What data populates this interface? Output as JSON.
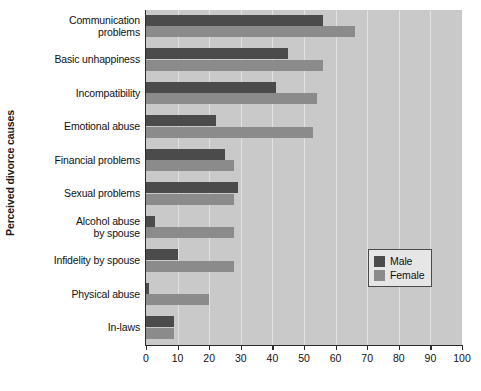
{
  "chart_data": {
    "type": "bar",
    "orientation": "horizontal",
    "title": "",
    "xlabel": "",
    "ylabel": "Perceived divorce causes",
    "xlim": [
      0,
      100
    ],
    "xticks": [
      0,
      10,
      20,
      30,
      40,
      50,
      60,
      70,
      80,
      90,
      100
    ],
    "grid": true,
    "legend_position": "center-right",
    "categories": [
      "Communication problems",
      "Basic unhappiness",
      "Incompatibility",
      "Emotional abuse",
      "Financial problems",
      "Sexual problems",
      "Alcohol abuse by spouse",
      "Infidelity by spouse",
      "Physical abuse",
      "In-laws"
    ],
    "series": [
      {
        "name": "Male",
        "color": "#4b4b4b",
        "values": [
          56,
          45,
          41,
          22,
          25,
          29,
          3,
          10,
          1,
          9
        ]
      },
      {
        "name": "Female",
        "color": "#8b8b8b",
        "values": [
          66,
          56,
          54,
          53,
          28,
          28,
          28,
          28,
          20,
          9
        ]
      }
    ]
  },
  "axis": {
    "y_title": "Perceived divorce causes",
    "x_tick_labels": [
      "0",
      "10",
      "20",
      "30",
      "40",
      "50",
      "60",
      "70",
      "80",
      "90",
      "100"
    ]
  },
  "category_labels": [
    {
      "line1": "Communication",
      "line2": "problems"
    },
    {
      "line1": "Basic unhappiness",
      "line2": ""
    },
    {
      "line1": "Incompatibility",
      "line2": ""
    },
    {
      "line1": "Emotional abuse",
      "line2": ""
    },
    {
      "line1": "Financial problems",
      "line2": ""
    },
    {
      "line1": "Sexual problems",
      "line2": ""
    },
    {
      "line1": "Alcohol abuse",
      "line2": "by spouse"
    },
    {
      "line1": "Infidelity by spouse",
      "line2": ""
    },
    {
      "line1": "Physical abuse",
      "line2": ""
    },
    {
      "line1": "In-laws",
      "line2": ""
    }
  ],
  "legend": {
    "items": [
      {
        "label": "Male",
        "color": "#4b4b4b"
      },
      {
        "label": "Female",
        "color": "#8b8b8b"
      }
    ]
  },
  "colors": {
    "plot_background": "#c9c9c9",
    "gridline": "#e2e2e2",
    "axis": "#2b2b2b",
    "male": "#4b4b4b",
    "female": "#8b8b8b",
    "legend_background": "#e6e6e6"
  }
}
